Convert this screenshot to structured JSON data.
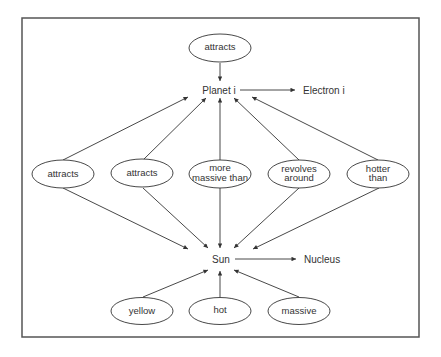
{
  "diagram": {
    "type": "semantic-network",
    "frame": {
      "x": 22,
      "y": 18,
      "w": 397,
      "h": 319,
      "stroke": "#555555"
    },
    "colors": {
      "line": "#333333",
      "text": "#333333",
      "background": "#ffffff"
    },
    "concepts": {
      "planet": {
        "label": "Planet i",
        "x": 232,
        "y": 91
      },
      "electron": {
        "label": "Electron i",
        "x": 320,
        "y": 91
      },
      "sun": {
        "label": "Sun",
        "x": 221,
        "y": 260
      },
      "nucleus": {
        "label": "Nucleus",
        "x": 320,
        "y": 260
      }
    },
    "relations": {
      "top": {
        "lines": [
          "attracts"
        ],
        "cx": 220,
        "cy": 48
      },
      "mid": [
        {
          "lines": [
            "attracts"
          ],
          "cx": 63,
          "cy": 174
        },
        {
          "lines": [
            "attracts"
          ],
          "cx": 142,
          "cy": 174
        },
        {
          "lines": [
            "more",
            "massive than"
          ],
          "cx": 220,
          "cy": 174
        },
        {
          "lines": [
            "revolves",
            "around"
          ],
          "cx": 299,
          "cy": 174
        },
        {
          "lines": [
            "hotter",
            "than"
          ],
          "cx": 378,
          "cy": 174
        }
      ],
      "attributes": [
        {
          "lines": [
            "yellow"
          ],
          "cx": 142,
          "cy": 311
        },
        {
          "lines": [
            "hot"
          ],
          "cx": 220,
          "cy": 311
        },
        {
          "lines": [
            "massive"
          ],
          "cx": 299,
          "cy": 311
        }
      ]
    }
  }
}
